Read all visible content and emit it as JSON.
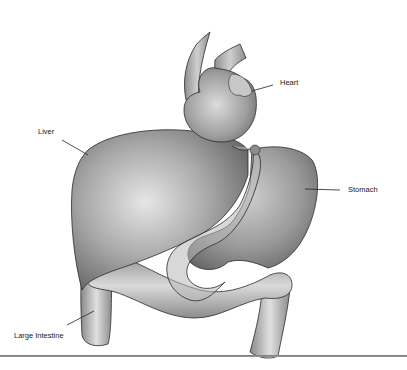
{
  "diagram": {
    "labels": {
      "heart": "Heart",
      "liver": "Liver",
      "stomach": "Stomach",
      "large_intestine": "Large Intestine"
    },
    "colors": {
      "organ_fill_dark": "#6e6e6e",
      "organ_fill_mid": "#9c9c9c",
      "organ_fill_light": "#d8d8d8",
      "outline": "#2a2a2a",
      "leader_line": "#222222",
      "rule": "#808080",
      "background": "#ffffff"
    }
  }
}
